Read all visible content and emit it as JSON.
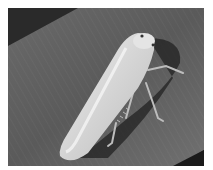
{
  "image": {
    "subject": "leafhopper insect on a leaf",
    "alt": "Pale green-white leafhopper resting on a dark grey striped leaf",
    "colors": {
      "background_dark": "#2a2a2a",
      "leaf": "#5e5e5e",
      "leaf_light": "#7a7a7a",
      "insect_body": "#d6d6d6",
      "insect_highlight": "#f2f2f2",
      "shadow": "#1e1e1e"
    }
  }
}
